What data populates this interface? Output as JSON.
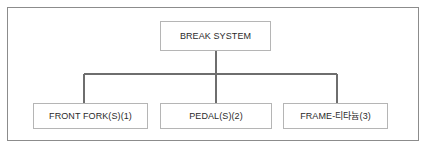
{
  "diagram": {
    "type": "organization-tree",
    "title_text": "BREAK SYSTEM",
    "frame": {
      "border_color": "#8c8c8c",
      "background_color": "#ffffff"
    },
    "style": {
      "node_border_color": "#b5b5b5",
      "connector_color": "#6e6e6e",
      "text_color": "#2b2b2b"
    },
    "root": {
      "label": "BREAK SYSTEM"
    },
    "children": [
      {
        "label": "FRONT FORK(S)(1)"
      },
      {
        "label": "PEDAL(S)(2)"
      },
      {
        "label": "FRAME-티타늄(3)"
      }
    ]
  }
}
